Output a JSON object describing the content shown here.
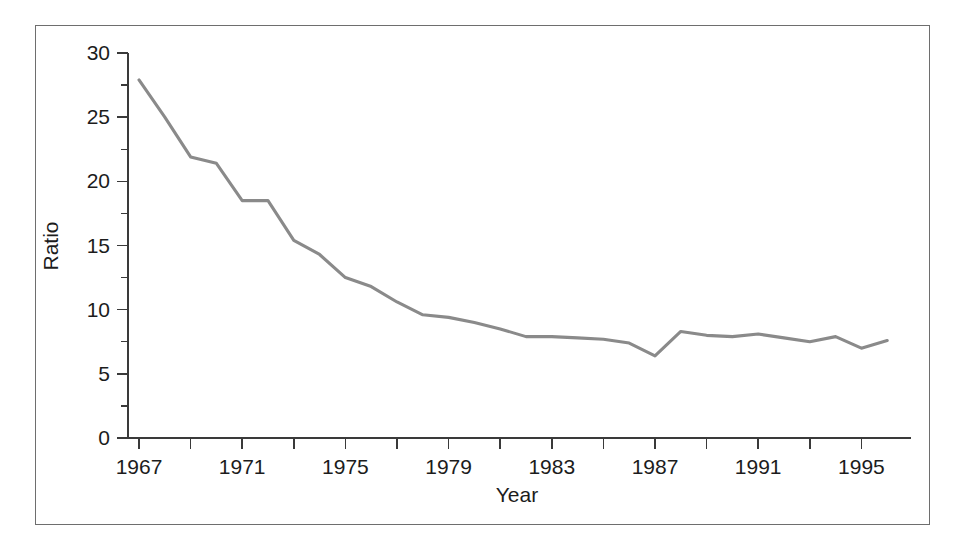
{
  "figure": {
    "border_color": "#6e6e6e",
    "background": "#ffffff"
  },
  "chart_data": {
    "type": "line",
    "title": "",
    "xlabel": "Year",
    "ylabel": "Ratio",
    "xlim": [
      1967,
      1996
    ],
    "ylim": [
      0,
      30
    ],
    "grid": false,
    "legend": "none",
    "line_color": "#8a8a8a",
    "x_tick_labels": [
      "1967",
      "1971",
      "1975",
      "1979",
      "1983",
      "1987",
      "1991",
      "1995"
    ],
    "x_tick_values": [
      1967,
      1971,
      1975,
      1979,
      1983,
      1987,
      1991,
      1995
    ],
    "x_minor_tick_values": [
      1969,
      1973,
      1977,
      1981,
      1985,
      1989,
      1993
    ],
    "y_tick_labels": [
      "0",
      "5",
      "10",
      "15",
      "20",
      "25",
      "30"
    ],
    "y_tick_values": [
      0,
      5,
      10,
      15,
      20,
      25,
      30
    ],
    "y_minor_tick_values": [
      2.5,
      7.5,
      12.5,
      17.5,
      22.5,
      27.5
    ],
    "x": [
      1967,
      1968,
      1969,
      1970,
      1971,
      1972,
      1973,
      1974,
      1975,
      1976,
      1977,
      1978,
      1979,
      1980,
      1981,
      1982,
      1983,
      1984,
      1985,
      1986,
      1987,
      1988,
      1989,
      1990,
      1991,
      1992,
      1993,
      1994,
      1995,
      1996
    ],
    "values": [
      27.9,
      25.0,
      21.9,
      21.4,
      18.5,
      18.5,
      15.4,
      14.3,
      12.5,
      11.8,
      10.6,
      9.6,
      9.4,
      9.0,
      8.5,
      7.9,
      7.9,
      7.8,
      7.7,
      7.4,
      6.4,
      8.3,
      8.0,
      7.9,
      8.1,
      7.8,
      7.5,
      7.9,
      7.0,
      7.6
    ],
    "series": [
      {
        "name": "Ratio",
        "values": [
          27.9,
          25.0,
          21.9,
          21.4,
          18.5,
          18.5,
          15.4,
          14.3,
          12.5,
          11.8,
          10.6,
          9.6,
          9.4,
          9.0,
          8.5,
          7.9,
          7.9,
          7.8,
          7.7,
          7.4,
          6.4,
          8.3,
          8.0,
          7.9,
          8.1,
          7.8,
          7.5,
          7.9,
          7.0,
          7.6
        ]
      }
    ]
  }
}
